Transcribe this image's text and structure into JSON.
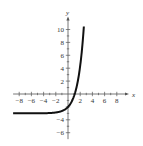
{
  "chart_data": {
    "type": "line",
    "title": "",
    "xlabel": "x",
    "ylabel": "y",
    "xlim": [
      -9,
      10
    ],
    "ylim": [
      -7,
      12
    ],
    "grid": false,
    "x_ticks": [
      -8,
      -6,
      -4,
      -2,
      2,
      4,
      6,
      8
    ],
    "y_ticks": [
      -6,
      -4,
      2,
      4,
      6,
      8,
      10
    ],
    "x_tick_labels": [
      "−8",
      "−6",
      "−4",
      "−2",
      "2",
      "4",
      "6",
      "8"
    ],
    "y_tick_labels": [
      "−6",
      "−4",
      "2",
      "4",
      "6",
      "8",
      "10"
    ],
    "series": [
      {
        "name": "curve",
        "function": "y = e^x - 3",
        "horizontal_asymptote": -3,
        "x": [
          -9,
          -6,
          -4,
          -2,
          -1,
          0,
          0.5,
          1,
          1.1,
          1.5,
          2,
          2.3,
          2.6
        ],
        "y": [
          -3.0,
          -3.0,
          -2.98,
          -2.86,
          -2.63,
          -2.0,
          -1.35,
          -0.28,
          0.0,
          1.48,
          4.39,
          6.97,
          10.46
        ]
      }
    ]
  },
  "axes": {
    "x_name": "x",
    "y_name": "y"
  }
}
